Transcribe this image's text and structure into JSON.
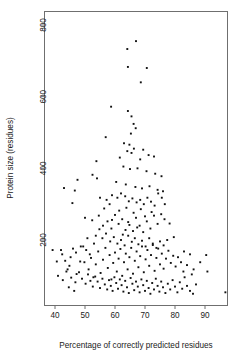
{
  "chart_data": {
    "type": "scatter",
    "title": "",
    "xlabel": "Percentage of correctly predicted residues",
    "ylabel": "Protein size (residues)",
    "xlim": [
      36,
      99
    ],
    "ylim": [
      30,
      870
    ],
    "xticks": [
      40,
      50,
      60,
      70,
      80,
      90
    ],
    "yticks": [
      200,
      400,
      600,
      800
    ],
    "grid": false,
    "legend": null,
    "marker": "square",
    "marker_color": "#111111",
    "n_points": 236,
    "series": [
      {
        "name": "proteins",
        "points": [
          [
            64.9,
            845
          ],
          [
            64.1,
            733
          ],
          [
            67.0,
            755
          ],
          [
            64.3,
            683
          ],
          [
            70.6,
            680
          ],
          [
            68.6,
            640
          ],
          [
            58.7,
            572
          ],
          [
            64.3,
            560
          ],
          [
            65.5,
            545
          ],
          [
            66.2,
            524
          ],
          [
            66.9,
            512
          ],
          [
            56.9,
            487
          ],
          [
            65.3,
            497
          ],
          [
            63.0,
            470
          ],
          [
            64.8,
            466
          ],
          [
            66.3,
            455
          ],
          [
            64.1,
            448
          ],
          [
            65.5,
            443
          ],
          [
            69.4,
            452
          ],
          [
            71.2,
            437
          ],
          [
            61.6,
            430
          ],
          [
            68.4,
            425
          ],
          [
            73.0,
            433
          ],
          [
            53.8,
            420
          ],
          [
            62.8,
            405
          ],
          [
            65.0,
            398
          ],
          [
            67.5,
            400
          ],
          [
            70.5,
            392
          ],
          [
            73.4,
            385
          ],
          [
            75.5,
            378
          ],
          [
            52.5,
            382
          ],
          [
            54.0,
            372
          ],
          [
            47.5,
            368
          ],
          [
            43.0,
            345
          ],
          [
            46.6,
            338
          ],
          [
            60.4,
            362
          ],
          [
            63.6,
            355
          ],
          [
            66.8,
            348
          ],
          [
            69.0,
            344
          ],
          [
            71.5,
            350
          ],
          [
            74.2,
            340
          ],
          [
            76.0,
            336
          ],
          [
            45.8,
            303
          ],
          [
            55.0,
            318
          ],
          [
            57.2,
            312
          ],
          [
            59.0,
            325
          ],
          [
            60.8,
            318
          ],
          [
            62.0,
            330
          ],
          [
            63.4,
            322
          ],
          [
            64.6,
            308
          ],
          [
            65.8,
            316
          ],
          [
            67.2,
            305
          ],
          [
            68.4,
            312
          ],
          [
            69.6,
            300
          ],
          [
            70.8,
            318
          ],
          [
            72.0,
            307
          ],
          [
            73.2,
            296
          ],
          [
            74.4,
            330
          ],
          [
            75.6,
            318
          ],
          [
            76.6,
            300
          ],
          [
            50.0,
            262
          ],
          [
            52.4,
            255
          ],
          [
            54.6,
            268
          ],
          [
            56.0,
            240
          ],
          [
            57.5,
            252
          ],
          [
            58.8,
            232
          ],
          [
            60.0,
            270
          ],
          [
            61.2,
            245
          ],
          [
            62.4,
            258
          ],
          [
            63.5,
            228
          ],
          [
            64.8,
            242
          ],
          [
            66.0,
            225
          ],
          [
            67.0,
            262
          ],
          [
            68.2,
            240
          ],
          [
            69.4,
            222
          ],
          [
            70.6,
            252
          ],
          [
            71.8,
            232
          ],
          [
            73.0,
            268
          ],
          [
            74.2,
            245
          ],
          [
            75.4,
            272
          ],
          [
            76.5,
            258
          ],
          [
            78.2,
            246
          ],
          [
            53.6,
            212
          ],
          [
            55.8,
            205
          ],
          [
            57.0,
            218
          ],
          [
            58.4,
            196
          ],
          [
            59.6,
            208
          ],
          [
            60.8,
            190
          ],
          [
            62.0,
            200
          ],
          [
            63.2,
            185
          ],
          [
            64.4,
            212
          ],
          [
            65.6,
            195
          ],
          [
            66.6,
            205
          ],
          [
            67.8,
            188
          ],
          [
            69.0,
            198
          ],
          [
            70.2,
            182
          ],
          [
            71.4,
            205
          ],
          [
            72.6,
            190
          ],
          [
            73.8,
            178
          ],
          [
            75.0,
            196
          ],
          [
            76.2,
            185
          ],
          [
            77.4,
            200
          ],
          [
            79.6,
            208
          ],
          [
            39.2,
            172
          ],
          [
            42.4,
            160
          ],
          [
            43.8,
            112
          ],
          [
            44.8,
            128
          ],
          [
            46.0,
            176
          ],
          [
            47.2,
            105
          ],
          [
            48.4,
            140
          ],
          [
            49.4,
            182
          ],
          [
            50.4,
            172
          ],
          [
            51.2,
            118
          ],
          [
            52.0,
            150
          ],
          [
            52.8,
            96
          ],
          [
            53.6,
            132
          ],
          [
            54.4,
            168
          ],
          [
            55.2,
            108
          ],
          [
            56.0,
            145
          ],
          [
            56.8,
            178
          ],
          [
            57.6,
            122
          ],
          [
            58.2,
            158
          ],
          [
            58.8,
            90
          ],
          [
            59.4,
            136
          ],
          [
            60.0,
            165
          ],
          [
            60.6,
            112
          ],
          [
            61.2,
            148
          ],
          [
            61.8,
            175
          ],
          [
            62.4,
            100
          ],
          [
            63.0,
            138
          ],
          [
            63.6,
            162
          ],
          [
            64.2,
            118
          ],
          [
            64.8,
            152
          ],
          [
            65.4,
            178
          ],
          [
            66.0,
            106
          ],
          [
            66.6,
            142
          ],
          [
            67.2,
            168
          ],
          [
            67.8,
            124
          ],
          [
            68.4,
            155
          ],
          [
            69.0,
            182
          ],
          [
            69.6,
            110
          ],
          [
            70.2,
            146
          ],
          [
            70.8,
            172
          ],
          [
            71.4,
            128
          ],
          [
            72.0,
            158
          ],
          [
            72.6,
            186
          ],
          [
            73.2,
            114
          ],
          [
            73.8,
            150
          ],
          [
            74.4,
            176
          ],
          [
            75.0,
            132
          ],
          [
            75.6,
            162
          ],
          [
            76.2,
            120
          ],
          [
            77.0,
            148
          ],
          [
            77.8,
            170
          ],
          [
            78.6,
            136
          ],
          [
            79.4,
            156
          ],
          [
            80.2,
            126
          ],
          [
            81.0,
            152
          ],
          [
            82.0,
            138
          ],
          [
            83.0,
            168
          ],
          [
            84.0,
            130
          ],
          [
            85.0,
            160
          ],
          [
            86.2,
            118
          ],
          [
            90.4,
            158
          ],
          [
            90.8,
            112
          ],
          [
            41.0,
            100
          ],
          [
            42.6,
            88
          ],
          [
            44.2,
            118
          ],
          [
            45.4,
            95
          ],
          [
            46.8,
            82
          ],
          [
            48.0,
            110
          ],
          [
            49.0,
            92
          ],
          [
            50.2,
            78
          ],
          [
            51.0,
            104
          ],
          [
            51.8,
            86
          ],
          [
            52.6,
            70
          ],
          [
            53.4,
            98
          ],
          [
            54.2,
            84
          ],
          [
            55.0,
            66
          ],
          [
            55.8,
            92
          ],
          [
            56.6,
            76
          ],
          [
            57.4,
            62
          ],
          [
            58.0,
            88
          ],
          [
            58.6,
            72
          ],
          [
            59.2,
            58
          ],
          [
            59.8,
            96
          ],
          [
            60.4,
            80
          ],
          [
            61.0,
            64
          ],
          [
            61.6,
            90
          ],
          [
            62.2,
            74
          ],
          [
            62.8,
            56
          ],
          [
            63.4,
            86
          ],
          [
            64.0,
            68
          ],
          [
            64.6,
            52
          ],
          [
            65.2,
            94
          ],
          [
            65.8,
            78
          ],
          [
            66.4,
            60
          ],
          [
            67.0,
            84
          ],
          [
            67.6,
            70
          ],
          [
            68.2,
            54
          ],
          [
            68.8,
            90
          ],
          [
            69.4,
            74
          ],
          [
            70.0,
            58
          ],
          [
            70.6,
            86
          ],
          [
            71.2,
            66
          ],
          [
            71.8,
            50
          ],
          [
            72.4,
            80
          ],
          [
            73.0,
            62
          ],
          [
            73.6,
            92
          ],
          [
            74.2,
            72
          ],
          [
            74.8,
            56
          ],
          [
            75.4,
            84
          ],
          [
            76.0,
            68
          ],
          [
            76.8,
            52
          ],
          [
            77.6,
            78
          ],
          [
            78.4,
            62
          ],
          [
            79.2,
            88
          ],
          [
            80.0,
            70
          ],
          [
            80.8,
            54
          ],
          [
            81.6,
            82
          ],
          [
            82.4,
            64
          ],
          [
            83.2,
            96
          ],
          [
            84.0,
            72
          ],
          [
            85.0,
            58
          ],
          [
            86.0,
            50
          ],
          [
            87.0,
            76
          ],
          [
            96.8,
            54
          ],
          [
            59.0,
            256
          ],
          [
            61.4,
            282
          ],
          [
            63.8,
            290
          ],
          [
            66.2,
            276
          ],
          [
            68.6,
            286
          ],
          [
            70.0,
            266
          ],
          [
            72.2,
            278
          ],
          [
            64.4,
            250
          ],
          [
            67.4,
            235
          ],
          [
            62.6,
            215
          ],
          [
            58.2,
            300
          ],
          [
            56.4,
            288
          ],
          [
            54.8,
            230
          ],
          [
            50.8,
            205
          ],
          [
            48.6,
            182
          ],
          [
            45.2,
            152
          ],
          [
            43.4,
            142
          ],
          [
            40.6,
            140
          ],
          [
            42.0,
            172
          ],
          [
            47.0,
            165
          ],
          [
            49.8,
            138
          ],
          [
            51.6,
            160
          ],
          [
            53.0,
            190
          ],
          [
            44.6,
            68
          ],
          [
            46.4,
            58
          ],
          [
            88.4,
            138
          ],
          [
            85.6,
            104
          ],
          [
            82.8,
            112
          ]
        ]
      }
    ]
  },
  "axes": {
    "x_tick_labels": [
      "40",
      "50",
      "60",
      "70",
      "80",
      "90"
    ],
    "y_tick_labels": [
      "200",
      "400",
      "600",
      "800"
    ]
  }
}
